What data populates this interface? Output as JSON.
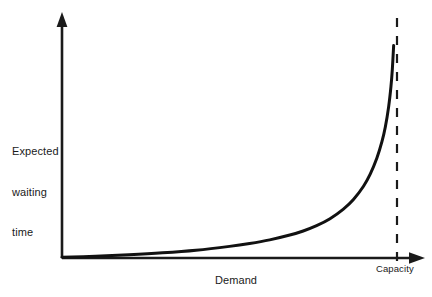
{
  "chart_data": {
    "type": "line",
    "title": "",
    "subtitle": "",
    "xlabel": "Demand",
    "ylabel": "Expected waiting time",
    "ylabel_lines": [
      "Expected",
      "waiting",
      "time"
    ],
    "grid": false,
    "legend": null,
    "axes": {
      "x_axis_arrow": true,
      "y_axis_arrow": true,
      "x_tick_labels": [],
      "y_tick_labels": [],
      "xlim": [
        0,
        1.08
      ],
      "ylim": [
        0,
        1
      ]
    },
    "annotations": [
      {
        "name": "capacity-line",
        "label": "Capacity",
        "style": "dashed-vertical",
        "x": 1.0,
        "description": "Vertical asymptote marking the capacity limit"
      }
    ],
    "series": [
      {
        "name": "Expected waiting time",
        "style": "solid",
        "color": "#111111",
        "description": "Waiting time grows slowly then rises asymptotically toward capacity",
        "x": [
          0.0,
          0.1,
          0.2,
          0.3,
          0.4,
          0.5,
          0.56,
          0.62,
          0.68,
          0.72,
          0.76,
          0.8,
          0.84,
          0.87,
          0.9,
          0.92,
          0.94,
          0.955,
          0.965,
          0.975,
          0.982,
          0.986,
          0.99
        ],
        "y": [
          0.0,
          0.004,
          0.01,
          0.018,
          0.029,
          0.045,
          0.057,
          0.072,
          0.092,
          0.109,
          0.131,
          0.16,
          0.2,
          0.24,
          0.295,
          0.345,
          0.412,
          0.48,
          0.54,
          0.625,
          0.71,
          0.78,
          0.88
        ]
      }
    ]
  },
  "colors": {
    "curve": "#111111",
    "axis": "#1a1a1a",
    "capacity_line": "#1a1a1a",
    "background": "#ffffff",
    "text": "#1a1a1a"
  }
}
